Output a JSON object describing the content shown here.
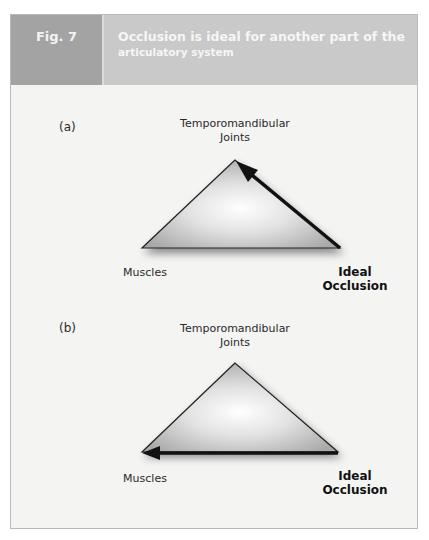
{
  "header": {
    "fig_label": "Fig. 7",
    "title_line1": "Occlusion is ideal for another part of the",
    "title_line2": "articulatory system"
  },
  "panels": [
    {
      "id": "a",
      "label": "(a)",
      "top_node": {
        "line1": "Temporomandibular",
        "line2": "Joints"
      },
      "left_node": "Muscles",
      "right_node": {
        "line1": "Ideal",
        "line2": "Occlusion"
      },
      "arrow": {
        "from": "Ideal Occlusion",
        "to": "Temporomandibular Joints"
      }
    },
    {
      "id": "b",
      "label": "(b)",
      "top_node": {
        "line1": "Temporomandibular",
        "line2": "Joints"
      },
      "left_node": "Muscles",
      "right_node": {
        "line1": "Ideal",
        "line2": "Occlusion"
      },
      "arrow": {
        "from": "Ideal Occlusion",
        "to": "Muscles"
      }
    }
  ],
  "colors": {
    "fig_box": "#a3a3a3",
    "title_box": "#c9c9c9",
    "frame_bg": "#f4f4f3",
    "arrow": "#111111"
  }
}
